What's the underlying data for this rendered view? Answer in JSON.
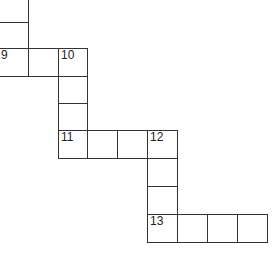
{
  "puzzle": {
    "type": "crossword-fragment",
    "line_color": "#333333",
    "cells": [
      {
        "x": -2,
        "y": -6,
        "w": 31,
        "h": 29,
        "number": ""
      },
      {
        "x": -2,
        "y": 22,
        "w": 31,
        "h": 27,
        "number": ""
      },
      {
        "x": -2,
        "y": 48,
        "w": 31,
        "h": 29,
        "number": "9"
      },
      {
        "x": 28,
        "y": 48,
        "w": 31,
        "h": 29,
        "number": ""
      },
      {
        "x": 58,
        "y": 48,
        "w": 30,
        "h": 29,
        "number": "10"
      },
      {
        "x": 58,
        "y": 76,
        "w": 30,
        "h": 28,
        "number": ""
      },
      {
        "x": 58,
        "y": 103,
        "w": 30,
        "h": 28,
        "number": ""
      },
      {
        "x": 58,
        "y": 130,
        "w": 30,
        "h": 29,
        "number": "11"
      },
      {
        "x": 87,
        "y": 130,
        "w": 31,
        "h": 29,
        "number": ""
      },
      {
        "x": 117,
        "y": 130,
        "w": 31,
        "h": 29,
        "number": ""
      },
      {
        "x": 147,
        "y": 130,
        "w": 31,
        "h": 29,
        "number": "12"
      },
      {
        "x": 147,
        "y": 158,
        "w": 31,
        "h": 29,
        "number": ""
      },
      {
        "x": 147,
        "y": 186,
        "w": 31,
        "h": 29,
        "number": ""
      },
      {
        "x": 147,
        "y": 214,
        "w": 31,
        "h": 29,
        "number": "13"
      },
      {
        "x": 177,
        "y": 214,
        "w": 31,
        "h": 29,
        "number": ""
      },
      {
        "x": 207,
        "y": 214,
        "w": 31,
        "h": 29,
        "number": ""
      },
      {
        "x": 237,
        "y": 214,
        "w": 31,
        "h": 29,
        "number": ""
      }
    ]
  }
}
